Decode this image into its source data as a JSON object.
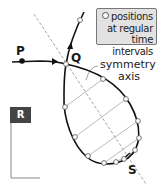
{
  "diagram": {
    "legend": {
      "line1": "positions",
      "line2": "at regular",
      "line3": "time intervals",
      "marker": "open-circle"
    },
    "labels": {
      "P": "P",
      "Q": "Q",
      "S": "S",
      "R": "R",
      "axis_line1": "symmetry",
      "axis_line2": "axis"
    },
    "colors": {
      "path": "#111111",
      "axis": "#888888",
      "chords": "#aaaaaa",
      "legend_bg": "#e2e2e2",
      "r_box": "#444444"
    }
  }
}
